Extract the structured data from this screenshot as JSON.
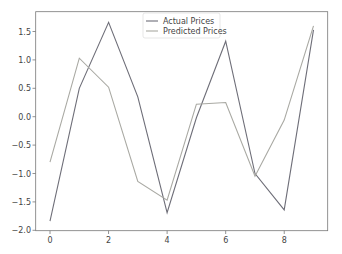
{
  "chart_data": {
    "type": "line",
    "title": "",
    "xlabel": "",
    "ylabel": "",
    "x": [
      0,
      1,
      2,
      3,
      4,
      5,
      6,
      7,
      8,
      9
    ],
    "series": [
      {
        "name": "Actual Prices",
        "color": "#6e6e78",
        "values": [
          -1.84,
          0.5,
          1.66,
          0.35,
          -1.69,
          -0.02,
          1.33,
          -1.0,
          -1.64,
          1.53
        ]
      },
      {
        "name": "Predicted Prices",
        "color": "#a9a9a3",
        "values": [
          -0.8,
          1.03,
          0.52,
          -1.14,
          -1.47,
          0.22,
          0.25,
          -1.05,
          -0.06,
          1.6
        ]
      }
    ],
    "xticks": [
      "0",
      "2",
      "4",
      "6",
      "8"
    ],
    "xtick_values": [
      0,
      2,
      4,
      6,
      8
    ],
    "yticks": [
      "−2.0",
      "−1.5",
      "−1.0",
      "−0.5",
      "0.0",
      "0.5",
      "1.0",
      "1.5"
    ],
    "ytick_values": [
      -2.0,
      -1.5,
      -1.0,
      -0.5,
      0.0,
      0.5,
      1.0,
      1.5
    ],
    "xlim": [
      -0.45,
      9.45
    ],
    "ylim": [
      -2.0,
      1.85
    ],
    "grid": false,
    "legend_position": "upper center"
  }
}
